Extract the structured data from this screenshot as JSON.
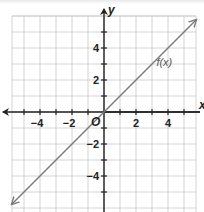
{
  "chart_data": {
    "type": "line",
    "title": "",
    "xlabel": "x",
    "ylabel": "y",
    "origin_label": "O",
    "xlim": [
      -5.75,
      5.75
    ],
    "ylim": [
      -6,
      6
    ],
    "grid": true,
    "x_ticks": [
      -5,
      -4,
      -3,
      -2,
      -1,
      1,
      2,
      3,
      4,
      5
    ],
    "y_ticks": [
      -5,
      -4,
      -3,
      -2,
      -1,
      1,
      2,
      3,
      4,
      5
    ],
    "x_tick_labels": [
      {
        "value": -4,
        "text": "−4"
      },
      {
        "value": -2,
        "text": "−2"
      },
      {
        "value": 2,
        "text": "2"
      },
      {
        "value": 4,
        "text": "4"
      }
    ],
    "y_tick_labels": [
      {
        "value": 4,
        "text": "4"
      },
      {
        "value": 2,
        "text": "2"
      },
      {
        "value": -2,
        "text": "−2"
      },
      {
        "value": -4,
        "text": "−4"
      }
    ],
    "series": [
      {
        "name": "f(x)",
        "equation": "y = x",
        "x": [
          -5.75,
          0,
          5.75
        ],
        "y": [
          -5.75,
          0,
          5.75
        ],
        "arrows": "both",
        "label_position": {
          "x": 3.4,
          "y": 3.1
        }
      }
    ],
    "annotations": [
      {
        "text": "f(x)",
        "x": 3.4,
        "y": 3.1
      }
    ],
    "colors": {
      "grid": "#c9c9c9",
      "axis": "#222222",
      "line": "#7a7a7a",
      "label": "#555555"
    }
  },
  "labels": {
    "x_axis": "x",
    "y_axis": "y",
    "origin": "O",
    "function": "f(x)"
  }
}
